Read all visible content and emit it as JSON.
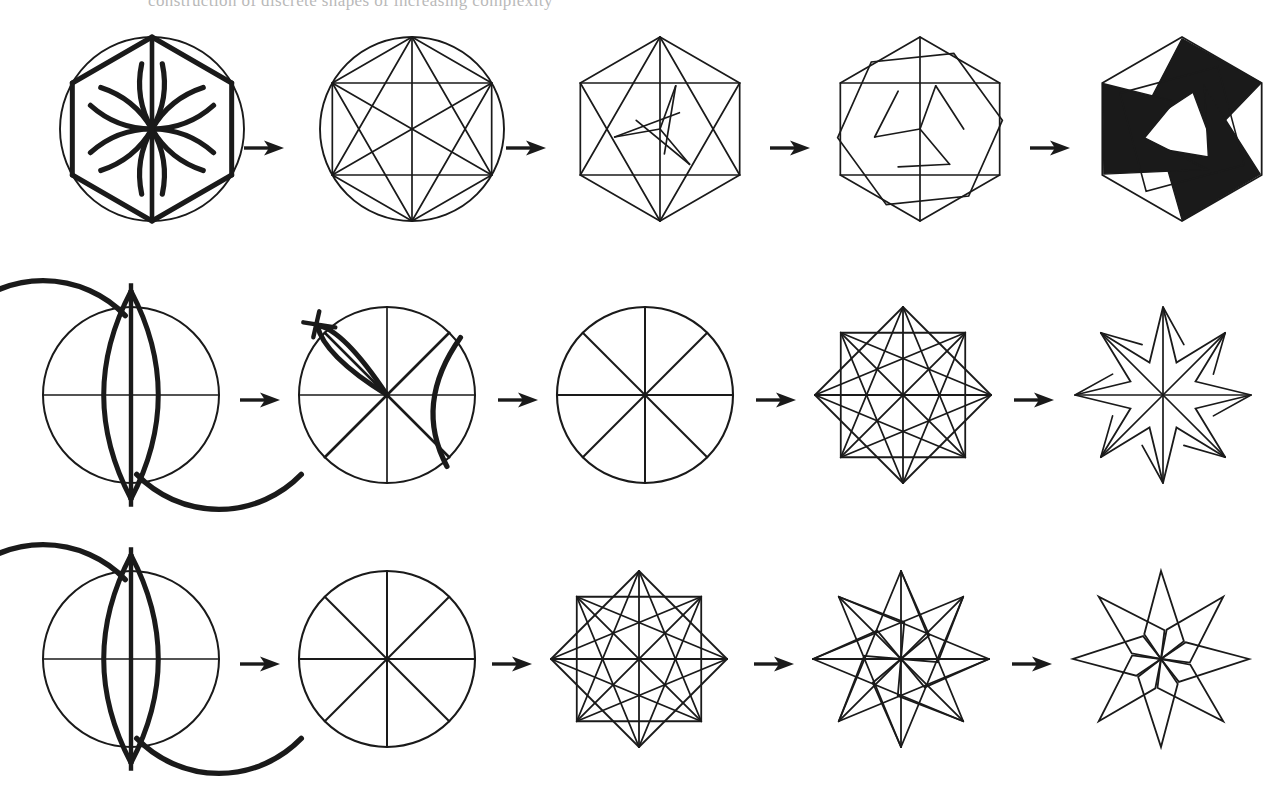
{
  "page": {
    "background_color": "#ffffff",
    "ink_color": "#1a1a1a",
    "width": 1286,
    "height": 790,
    "partial_caption_top": "construction of discrete shapes of increasing complexity"
  },
  "arrow": {
    "name": "right-arrow",
    "glyph": "→",
    "color": "#141414"
  },
  "rows": [
    {
      "id": "row-hexagon",
      "label": "Hexagonal pinwheel construction",
      "top": 24,
      "steps": [
        {
          "id": "r1s1",
          "label": "Circle with compass arcs marking six points",
          "type": "hex-arcs",
          "cx": 124,
          "cy": 105,
          "r": 92,
          "left": 28,
          "size": 215
        },
        {
          "id": "r1s2",
          "label": "Hexagon with all diagonals inscribed in circle",
          "type": "hex-complete",
          "cx": 124,
          "cy": 105,
          "r": 92,
          "left": 288,
          "size": 215
        },
        {
          "id": "r1s3",
          "label": "Selected chords forming rotational framework",
          "type": "hex-select1",
          "cx": 100,
          "cy": 105,
          "r": 92,
          "left": 560,
          "size": 205
        },
        {
          "id": "r1s4",
          "label": "Pinwheel outline emerging from framework",
          "type": "hex-select2",
          "cx": 100,
          "cy": 105,
          "r": 92,
          "left": 820,
          "size": 205
        },
        {
          "id": "r1s5",
          "label": "Finished three-fold pinwheel, filled black",
          "type": "hex-filled",
          "cx": 100,
          "cy": 105,
          "r": 92,
          "left": 1082,
          "size": 205
        }
      ]
    },
    {
      "id": "row-star8-a",
      "label": "Eight-pointed compass rose construction",
      "top": 288,
      "steps": [
        {
          "id": "r2s1",
          "label": "Vesica piscis perpendicular bisector",
          "type": "vesica",
          "cx": 105,
          "cy": 107,
          "r": 88,
          "left": 26,
          "size": 215
        },
        {
          "id": "r2s2",
          "label": "Angle bisection arcs dividing circle into eight",
          "type": "bisect",
          "cx": 105,
          "cy": 107,
          "r": 88,
          "left": 282,
          "size": 215
        },
        {
          "id": "r2s3",
          "label": "Circle divided into eight equal sectors",
          "type": "octant",
          "cx": 105,
          "cy": 107,
          "r": 88,
          "left": 540,
          "size": 215
        },
        {
          "id": "r2s4",
          "label": "Star polygon with all eight-point chords",
          "type": "star8-full",
          "cx": 105,
          "cy": 107,
          "r": 88,
          "left": 798,
          "size": 215
        },
        {
          "id": "r2s5",
          "label": "Eight-point compass rose outline",
          "type": "star8-rose",
          "cx": 105,
          "cy": 107,
          "r": 88,
          "left": 1058,
          "size": 215
        }
      ]
    },
    {
      "id": "row-star8-b",
      "label": "Eight-pointed pinwheel star construction",
      "top": 552,
      "steps": [
        {
          "id": "r3s1",
          "label": "Vesica piscis perpendicular bisector",
          "type": "vesica",
          "cx": 105,
          "cy": 107,
          "r": 88,
          "left": 26,
          "size": 215
        },
        {
          "id": "r3s2",
          "label": "Circle divided into eight equal sectors",
          "type": "octant",
          "cx": 105,
          "cy": 107,
          "r": 88,
          "left": 282,
          "size": 215
        },
        {
          "id": "r3s3",
          "label": "Star polygon with all eight-point chords",
          "type": "star8-full",
          "cx": 105,
          "cy": 107,
          "r": 88,
          "left": 534,
          "size": 215
        },
        {
          "id": "r3s4",
          "label": "Overlapping rotated star chords",
          "type": "star8-rot",
          "cx": 105,
          "cy": 107,
          "r": 88,
          "left": 796,
          "size": 215
        },
        {
          "id": "r3s5",
          "label": "Finished eight-point pinwheel star outline",
          "type": "star8-pinwheel",
          "cx": 105,
          "cy": 107,
          "r": 88,
          "left": 1056,
          "size": 215
        }
      ]
    }
  ],
  "arrow_positions": [
    {
      "row": 0,
      "left": 244,
      "top": 112
    },
    {
      "row": 0,
      "left": 506,
      "top": 112
    },
    {
      "row": 0,
      "left": 770,
      "top": 112
    },
    {
      "row": 0,
      "left": 1030,
      "top": 112
    },
    {
      "row": 1,
      "left": 240,
      "top": 100
    },
    {
      "row": 1,
      "left": 498,
      "top": 100
    },
    {
      "row": 1,
      "left": 756,
      "top": 100
    },
    {
      "row": 1,
      "left": 1014,
      "top": 100
    },
    {
      "row": 2,
      "left": 240,
      "top": 100
    },
    {
      "row": 2,
      "left": 492,
      "top": 100
    },
    {
      "row": 2,
      "left": 754,
      "top": 100
    },
    {
      "row": 2,
      "left": 1012,
      "top": 100
    }
  ],
  "chart_data": {
    "type": "diagram",
    "sequences": [
      {
        "name": "Hexagonal pinwheel",
        "divisions": 6,
        "stages": [
          "compass arcs on circle",
          "hexagon with all diagonals",
          "selected chords",
          "pinwheel outline",
          "filled black pinwheel"
        ]
      },
      {
        "name": "Eight-point compass rose",
        "divisions": 8,
        "stages": [
          "vesica piscis",
          "angle bisection",
          "eight sectors",
          "full star chords",
          "rose outline"
        ]
      },
      {
        "name": "Eight-point pinwheel star",
        "divisions": 8,
        "stages": [
          "vesica piscis",
          "eight sectors",
          "full star chords",
          "rotated star chords",
          "pinwheel star outline"
        ]
      }
    ]
  }
}
